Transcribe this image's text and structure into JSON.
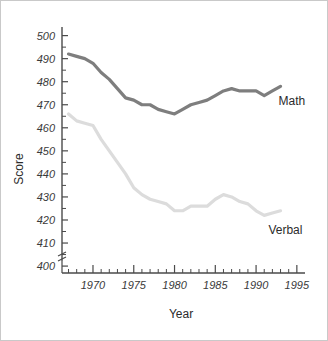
{
  "chart_data": {
    "type": "line",
    "title": "",
    "xlabel": "Year",
    "ylabel": "Score",
    "xlim": [
      1966,
      1996
    ],
    "ylim": [
      395,
      503
    ],
    "grid": false,
    "legend_position": "inline-right-of-line-end",
    "y_axis_break": true,
    "y_ticks": [
      400,
      410,
      420,
      430,
      440,
      450,
      460,
      470,
      480,
      490,
      500
    ],
    "y_tick_labels": [
      "400",
      "410",
      "420",
      "430",
      "440",
      "450",
      "460",
      "470",
      "480",
      "490",
      "500"
    ],
    "x_ticks": [
      1970,
      1975,
      1980,
      1985,
      1990,
      1995
    ],
    "x_tick_labels": [
      "1970",
      "1975",
      "1980",
      "1985",
      "1990",
      "1995"
    ],
    "x_minor_tick_step": 1,
    "x_minor_tick_range": [
      1967,
      1995
    ],
    "x": [
      1967,
      1968,
      1969,
      1970,
      1971,
      1972,
      1973,
      1974,
      1975,
      1976,
      1977,
      1978,
      1979,
      1980,
      1981,
      1982,
      1983,
      1984,
      1985,
      1986,
      1987,
      1988,
      1989,
      1990,
      1991,
      1992,
      1993
    ],
    "series": [
      {
        "name": "Math",
        "color": "#7e7e7e",
        "values": [
          492,
          491,
          490,
          488,
          484,
          481,
          477,
          473,
          472,
          470,
          470,
          468,
          467,
          466,
          468,
          470,
          471,
          472,
          474,
          476,
          477,
          476,
          476,
          476,
          474,
          476,
          478
        ]
      },
      {
        "name": "Verbal",
        "color": "#dcdcdc",
        "values": [
          466,
          463,
          462,
          461,
          455,
          450,
          445,
          440,
          434,
          431,
          429,
          428,
          427,
          424,
          424,
          426,
          426,
          426,
          429,
          431,
          430,
          428,
          427,
          424,
          422,
          423,
          424
        ]
      }
    ],
    "annotations": [
      {
        "text": "Math",
        "series": "Math",
        "x": 1994.4,
        "y": 470
      },
      {
        "text": "Verbal",
        "series": "Verbal",
        "x": 1993.6,
        "y": 414
      }
    ]
  }
}
